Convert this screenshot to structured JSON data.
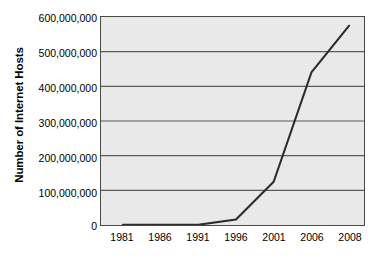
{
  "chart_data": {
    "type": "line",
    "title": "",
    "subtitle": "",
    "xlabel": "",
    "ylabel": "Number of Internet Hosts",
    "x": [
      1981,
      1986,
      1991,
      1996,
      2001,
      2006,
      2008
    ],
    "categories": [
      "1981",
      "1986",
      "1991",
      "1996",
      "2001",
      "2006",
      "2008"
    ],
    "values": [
      200,
      5000,
      600000,
      16000000,
      125000000,
      440000000,
      575000000
    ],
    "series": [
      {
        "name": "Internet hosts",
        "values": [
          200,
          5000,
          600000,
          16000000,
          125000000,
          440000000,
          575000000
        ]
      }
    ],
    "ylim": [
      0,
      600000000
    ],
    "yticks": [
      0,
      100000000,
      200000000,
      300000000,
      400000000,
      500000000,
      600000000
    ],
    "ytick_labels": [
      "0",
      "100,000,000",
      "200,000,000",
      "300,000,000",
      "400,000,000",
      "500,000,000",
      "600,000,000"
    ],
    "xtick_labels": [
      "1981",
      "1986",
      "1991",
      "1996",
      "2001",
      "2006",
      "2008"
    ],
    "grid": "horizontal",
    "legend": "none",
    "line_color": "#2b2b2b",
    "plot_background": "#e9e9e9",
    "axis_color": "#4a4a4a",
    "gridline_color": "#5a5a5a"
  },
  "axes": {
    "y": {
      "title": "Number of Internet Hosts",
      "ticks": [
        {
          "label": "600,000,000",
          "value": 600000000
        },
        {
          "label": "500,000,000",
          "value": 500000000
        },
        {
          "label": "400,000,000",
          "value": 400000000
        },
        {
          "label": "300,000,000",
          "value": 300000000
        },
        {
          "label": "200,000,000",
          "value": 200000000
        },
        {
          "label": "100,000,000",
          "value": 100000000
        },
        {
          "label": "0",
          "value": 0
        }
      ]
    },
    "x": {
      "title": "",
      "ticks": [
        {
          "label": "1981"
        },
        {
          "label": "1986"
        },
        {
          "label": "1991"
        },
        {
          "label": "1996"
        },
        {
          "label": "2001"
        },
        {
          "label": "2006"
        },
        {
          "label": "2008"
        }
      ]
    }
  }
}
